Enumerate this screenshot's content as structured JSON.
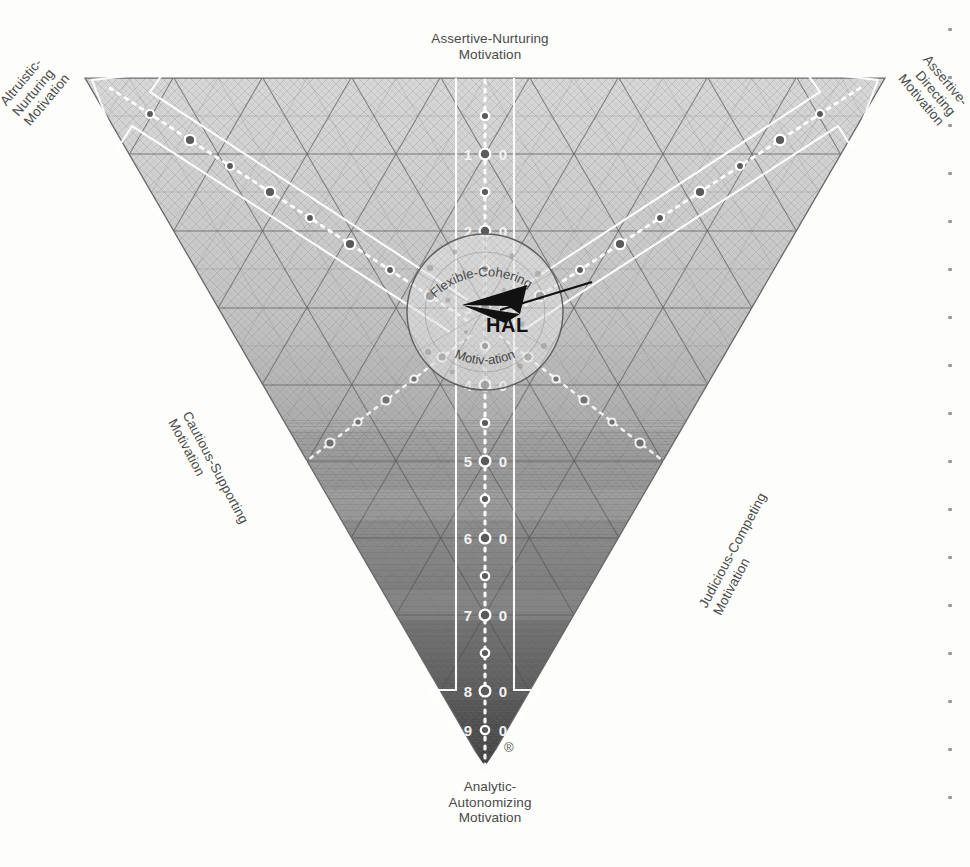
{
  "vertex_labels": {
    "top_left": "Altruistic-\nNurturing\nMotivation",
    "top_center": "Assertive-Nurturing\nMotivation",
    "top_right": "Assertive-\nDirecting\nMotivation",
    "bottom_left": "Cautious-Supporting\nMotivation",
    "bottom_right": "Judicious-Competing\nMotivation",
    "bottom_center": "Analytic-\nAutonomizing\nMotivation"
  },
  "center": {
    "arc_top": "Flexible-Cohering",
    "arc_bottom": "Motiv-ation",
    "marker_label": "HAL"
  },
  "trademark": "®",
  "colors": {
    "ink": "#4a4a4a",
    "grid_light": "#b9b9b9",
    "grid_dark": "#6e6e6e",
    "fill_light": "#d2d2d2",
    "fill_dark": "#4d4d4d",
    "arrow": "#111111",
    "axis_white": "#ffffff"
  },
  "chart_data": {
    "type": "scatter",
    "xlabel": "",
    "ylabel": "",
    "grid": true,
    "legend_position": "none",
    "axes": [
      {
        "name": "Analytic-Autonomizing Motivation",
        "orientation": "vertical-down",
        "tick_labels": [
          "1.0",
          "2.0",
          "3.0",
          "4.0",
          "5.0",
          "6.0",
          "7.0",
          "8.0",
          "9.0"
        ],
        "minor_ticks_between": 1,
        "range": [
          0,
          10
        ]
      },
      {
        "name": "Altruistic-Nurturing Motivation",
        "orientation": "diagonal-upper-left",
        "tick_labels": [
          "1.0",
          "2.0",
          "3.0",
          "4.0",
          "5.0",
          "6.0",
          "7.0",
          "8.0",
          "9.0"
        ],
        "range": [
          0,
          10
        ]
      },
      {
        "name": "Assertive-Directing Motivation",
        "orientation": "diagonal-upper-right",
        "tick_labels": [
          "1.0",
          "2.0",
          "3.0",
          "4.0",
          "5.0",
          "6.0",
          "7.0",
          "8.0",
          "9.0"
        ],
        "range": [
          0,
          10
        ]
      }
    ],
    "annotations": [
      {
        "text": "HAL",
        "x": 0.485,
        "y": 0.355,
        "marker": "arrow",
        "arrow_from_x": 0.6,
        "arrow_from_y": 0.325
      },
      {
        "text": "Flexible-Cohering Motivation",
        "x": 0.5,
        "y": 0.365,
        "marker": "center-circle"
      }
    ],
    "vertex_labels": [
      "Altruistic-Nurturing Motivation",
      "Assertive-Nurturing Motivation",
      "Assertive-Directing Motivation",
      "Cautious-Supporting Motivation",
      "Judicious-Competing Motivation",
      "Analytic-Autonomizing Motivation"
    ],
    "series": [
      {
        "name": "HAL",
        "x": [
          0.485
        ],
        "y": [
          0.355
        ],
        "values": [
          1
        ]
      }
    ]
  },
  "edge_dots_count": 17
}
